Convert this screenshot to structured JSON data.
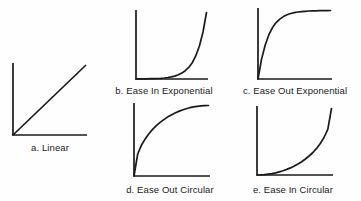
{
  "figure": {
    "background": "#fefefe",
    "line_color": "#1a1a1a",
    "text_color": "#1a1a1a"
  },
  "chart_data": [
    {
      "type": "line",
      "title": "a. Linear",
      "easing": "linear",
      "xlim": [
        0,
        1
      ],
      "ylim": [
        0,
        1
      ],
      "grid": false,
      "legend": "none",
      "axes_style": "L-shaped, no ticks, no labels",
      "x": [
        0,
        1
      ],
      "y": [
        0,
        1
      ]
    },
    {
      "type": "line",
      "title": "b. Ease In Exponential",
      "easing": "ease-in-exponential",
      "xlim": [
        0,
        1
      ],
      "ylim": [
        0,
        1
      ],
      "grid": false,
      "legend": "none",
      "axes_style": "L-shaped, no ticks, no labels",
      "x": [
        0,
        0.05,
        0.1,
        0.15,
        0.2,
        0.25,
        0.3,
        0.35,
        0.4,
        0.45,
        0.5,
        0.55,
        0.6,
        0.65,
        0.7,
        0.75,
        0.8,
        0.85,
        0.9,
        0.95,
        1
      ],
      "y": [
        0.001,
        0.0014,
        0.002,
        0.0028,
        0.0039,
        0.0055,
        0.0078,
        0.011,
        0.0156,
        0.0221,
        0.0313,
        0.0442,
        0.0625,
        0.0884,
        0.125,
        0.1768,
        0.25,
        0.3536,
        0.5,
        0.7071,
        1
      ]
    },
    {
      "type": "line",
      "title": "c. Ease Out Exponential",
      "easing": "ease-out-exponential",
      "xlim": [
        0,
        1
      ],
      "ylim": [
        0,
        1
      ],
      "grid": false,
      "legend": "none",
      "axes_style": "L-shaped, no ticks, no labels",
      "x": [
        0,
        0.05,
        0.1,
        0.15,
        0.2,
        0.25,
        0.3,
        0.35,
        0.4,
        0.45,
        0.5,
        0.55,
        0.6,
        0.65,
        0.7,
        0.75,
        0.8,
        0.85,
        0.9,
        0.95,
        1
      ],
      "y": [
        0,
        0.2929,
        0.5,
        0.6464,
        0.75,
        0.8232,
        0.875,
        0.9116,
        0.9375,
        0.9558,
        0.9688,
        0.9779,
        0.9844,
        0.989,
        0.9922,
        0.9945,
        0.9961,
        0.9972,
        0.998,
        0.9986,
        1
      ]
    },
    {
      "type": "line",
      "title": "d. Ease Out Circular",
      "easing": "ease-out-circular",
      "xlim": [
        0,
        1
      ],
      "ylim": [
        0,
        1
      ],
      "grid": false,
      "legend": "none",
      "axes_style": "L-shaped, no ticks, no labels",
      "x": [
        0,
        0.05,
        0.1,
        0.15,
        0.2,
        0.25,
        0.3,
        0.35,
        0.4,
        0.45,
        0.5,
        0.55,
        0.6,
        0.65,
        0.7,
        0.75,
        0.8,
        0.85,
        0.9,
        0.95,
        1
      ],
      "y": [
        0,
        0.3122,
        0.4359,
        0.5268,
        0.6,
        0.6614,
        0.7141,
        0.7599,
        0.8,
        0.8352,
        0.866,
        0.893,
        0.9165,
        0.9368,
        0.9539,
        0.9682,
        0.9798,
        0.9887,
        0.995,
        0.9987,
        1
      ]
    },
    {
      "type": "line",
      "title": "e. Ease In Circular",
      "easing": "ease-in-circular",
      "xlim": [
        0,
        1
      ],
      "ylim": [
        0,
        1
      ],
      "grid": false,
      "legend": "none",
      "axes_style": "L-shaped, no ticks, no labels",
      "x": [
        0,
        0.05,
        0.1,
        0.15,
        0.2,
        0.25,
        0.3,
        0.35,
        0.4,
        0.45,
        0.5,
        0.55,
        0.6,
        0.65,
        0.7,
        0.75,
        0.8,
        0.85,
        0.9,
        0.95,
        1
      ],
      "y": [
        0,
        0.0013,
        0.005,
        0.0113,
        0.0202,
        0.0318,
        0.0461,
        0.0633,
        0.0835,
        0.1068,
        0.134,
        0.1648,
        0.2,
        0.2402,
        0.2859,
        0.3386,
        0.4,
        0.4732,
        0.5641,
        0.6878,
        1
      ]
    }
  ]
}
